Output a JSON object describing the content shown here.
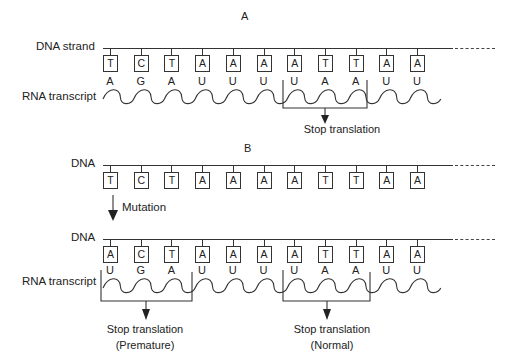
{
  "panel_a": {
    "title": "A",
    "dna_label": "DNA strand",
    "rna_label": "RNA transcript",
    "dna_bases": [
      "T",
      "C",
      "T",
      "A",
      "A",
      "A",
      "A",
      "T",
      "T",
      "A",
      "A"
    ],
    "rna_bases": [
      "A",
      "G",
      "A",
      "U",
      "U",
      "U",
      "U",
      "A",
      "A",
      "U",
      "U",
      "U"
    ],
    "stop_label": "Stop translation"
  },
  "panel_b": {
    "title": "B",
    "dna_label_1": "DNA",
    "dna_bases_1": [
      "T",
      "C",
      "T",
      "A",
      "A",
      "A",
      "A",
      "T",
      "T",
      "A",
      "A"
    ],
    "mutation_label": "Mutation",
    "dna_label_2": "DNA",
    "dna_bases_2": [
      "A",
      "C",
      "T",
      "A",
      "A",
      "A",
      "A",
      "T",
      "T",
      "A",
      "A"
    ],
    "rna_label": "RNA transcript",
    "rna_bases": [
      "U",
      "G",
      "A",
      "U",
      "U",
      "U",
      "U",
      "A",
      "A",
      "U",
      "U",
      "U"
    ],
    "stop_premature_label": "Stop translation",
    "stop_premature_note": "(Premature)",
    "stop_normal_label": "Stop translation",
    "stop_normal_note": "(Normal)"
  },
  "colors": {
    "line": "#333333",
    "text": "#222222",
    "background": "#ffffff"
  }
}
